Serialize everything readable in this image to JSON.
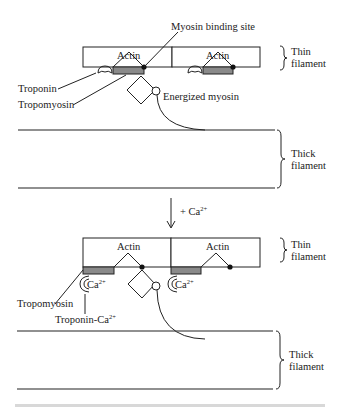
{
  "diagram": {
    "type": "muscle-contraction-regulation",
    "colors": {
      "line": "#222222",
      "tropomyosin_fill": "#8a8a8a",
      "background": "#ffffff"
    },
    "top_panel": {
      "state": "relaxed (no calcium)",
      "labels": {
        "myosin_binding_site": "Myosin binding site",
        "actin_left": "Actin",
        "actin_right": "Actin",
        "troponin": "Troponin",
        "tropomyosin": "Tropomyosin",
        "energized_myosin": "Energized myosin",
        "thin_filament_line1": "Thin",
        "thin_filament_line2": "filament",
        "thick_filament_line1": "Thick",
        "thick_filament_line2": "filament"
      }
    },
    "transition": {
      "label": "+ Ca",
      "superscript": "2+"
    },
    "bottom_panel": {
      "state": "calcium bound",
      "labels": {
        "actin_left": "Actin",
        "actin_right": "Actin",
        "ca_left": "Ca",
        "ca_left_sup": "2+",
        "ca_right": "Ca",
        "ca_right_sup": "2+",
        "tropomyosin": "Tropomyosin",
        "troponin_ca": "Troponin-Ca",
        "troponin_ca_sup": "2+",
        "thin_filament_line1": "Thin",
        "thin_filament_line2": "filament",
        "thick_filament_line1": "Thick",
        "thick_filament_line2": "filament"
      }
    }
  }
}
